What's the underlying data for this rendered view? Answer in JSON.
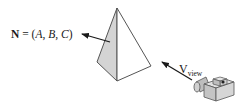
{
  "diagram": {
    "normal_label": {
      "symbol": "N",
      "equals": " = (",
      "a": "A",
      "sep1": ", ",
      "b": "B",
      "sep2": ", ",
      "c": "C",
      "close": ")"
    },
    "view_label": {
      "symbol": "V",
      "subscript": "view"
    },
    "colors": {
      "shaded_face": "#d4d4d4",
      "lit_face": "#ffffff",
      "stroke": "#4a4a4a",
      "arrow": "#1a1a1a",
      "camera_body": "#cfcfcf",
      "camera_dark": "#8a8a8a"
    }
  }
}
